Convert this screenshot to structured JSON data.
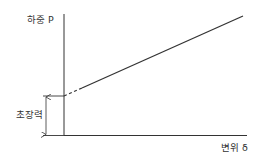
{
  "diagram": {
    "y_axis_label": "하중 P",
    "x_axis_label": "변위 δ",
    "preload_label": "초장력",
    "colors": {
      "line": "#333333",
      "background": "#ffffff"
    }
  }
}
